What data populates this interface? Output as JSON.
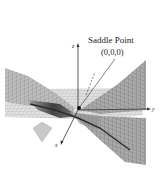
{
  "figure": {
    "annotation": {
      "title": "Saddle Point",
      "coords": "(0,0,0)"
    },
    "axes": {
      "x": "x",
      "y": "y",
      "z": "z"
    },
    "colors": {
      "background": "#ffffff",
      "surface_light": "#d9d9d9",
      "surface_mid": "#a8a8a8",
      "surface_dark": "#5a5a5a",
      "grid": "#8c8c8c",
      "axis": "#333333",
      "point": "#111111"
    }
  }
}
